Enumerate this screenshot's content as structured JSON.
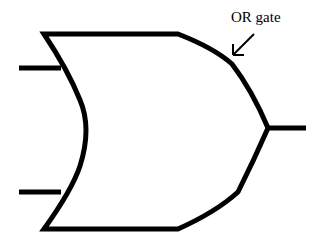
{
  "diagram": {
    "title": "OR gate",
    "annotation": {
      "text": "OR gate",
      "arrow": "pointing to gate curve"
    },
    "gate": {
      "type": "OR",
      "inputs": 2,
      "outputs": 1
    },
    "colors": {
      "stroke": "#000000",
      "background": "#ffffff"
    }
  }
}
